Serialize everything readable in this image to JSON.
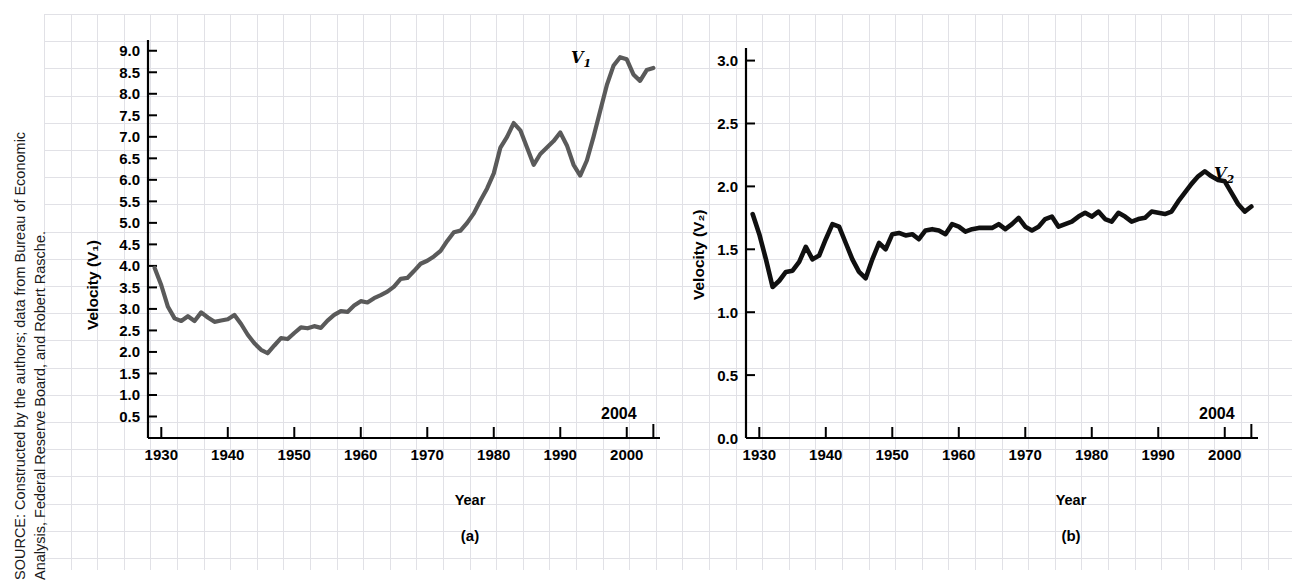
{
  "source_note": "SOURCE: Constructed by the authors; data from Bureau of Economic\nAnalysis, Federal Reserve Board, and Robert Rasche.",
  "colors": {
    "v1_line": "#5a5a5a",
    "v2_line": "#101010",
    "axis": "#000000",
    "grid": "#c9c9d2"
  },
  "chart_data": [
    {
      "type": "line",
      "panel": "a",
      "caption": "(a)",
      "title": "",
      "xlabel": "Year",
      "ylabel": "Velocity (V₁)",
      "series_label": "V",
      "series_subscript": "1",
      "end_year_label": "2004",
      "xlim": [
        1928,
        2005
      ],
      "ylim": [
        0,
        9.25
      ],
      "xticks": [
        1930,
        1940,
        1950,
        1960,
        1970,
        1980,
        1990,
        2000
      ],
      "xtick_labels": [
        "1930",
        "1940",
        "1950",
        "1960",
        "1970",
        "1980",
        "1990",
        "2000"
      ],
      "yticks": [
        0.5,
        1.0,
        1.5,
        2.0,
        2.5,
        3.0,
        3.5,
        4.0,
        4.5,
        5.0,
        5.5,
        6.0,
        6.5,
        7.0,
        7.5,
        8.0,
        8.5,
        9.0
      ],
      "ytick_labels": [
        "0.5",
        "1.0",
        "1.5",
        "2.0",
        "2.5",
        "3.0",
        "3.5",
        "4.0",
        "4.5",
        "5.0",
        "5.5",
        "6.0",
        "6.5",
        "7.0",
        "7.5",
        "8.0",
        "8.5",
        "9.0"
      ],
      "grid": false,
      "legend": "inline-annotation",
      "x": [
        1929,
        1930,
        1931,
        1932,
        1933,
        1934,
        1935,
        1936,
        1937,
        1938,
        1939,
        1940,
        1941,
        1942,
        1943,
        1944,
        1945,
        1946,
        1947,
        1948,
        1949,
        1950,
        1951,
        1952,
        1953,
        1954,
        1955,
        1956,
        1957,
        1958,
        1959,
        1960,
        1961,
        1962,
        1963,
        1964,
        1965,
        1966,
        1967,
        1968,
        1969,
        1970,
        1971,
        1972,
        1973,
        1974,
        1975,
        1976,
        1977,
        1978,
        1979,
        1980,
        1981,
        1982,
        1983,
        1984,
        1985,
        1986,
        1987,
        1988,
        1989,
        1990,
        1991,
        1992,
        1993,
        1994,
        1995,
        1996,
        1997,
        1998,
        1999,
        2000,
        2001,
        2002,
        2003,
        2004
      ],
      "values": [
        3.95,
        3.55,
        3.05,
        2.78,
        2.72,
        2.83,
        2.72,
        2.92,
        2.8,
        2.7,
        2.73,
        2.76,
        2.86,
        2.65,
        2.4,
        2.2,
        2.05,
        1.97,
        2.15,
        2.32,
        2.3,
        2.44,
        2.57,
        2.55,
        2.6,
        2.56,
        2.73,
        2.86,
        2.95,
        2.93,
        3.08,
        3.18,
        3.15,
        3.25,
        3.32,
        3.4,
        3.52,
        3.7,
        3.72,
        3.88,
        4.05,
        4.12,
        4.22,
        4.35,
        4.58,
        4.78,
        4.82,
        5.0,
        5.22,
        5.52,
        5.8,
        6.15,
        6.75,
        7.0,
        7.32,
        7.15,
        6.75,
        6.35,
        6.6,
        6.75,
        6.9,
        7.1,
        6.8,
        6.35,
        6.1,
        6.45,
        7.0,
        7.6,
        8.2,
        8.65,
        8.85,
        8.8,
        8.45,
        8.3,
        8.55,
        8.6
      ],
      "annotations": [
        {
          "text": "2004",
          "at_x": 2004,
          "position": "above-axis-right"
        },
        {
          "text": "V₁",
          "at_x": 1999,
          "at_y": 9.0,
          "position": "near-curve-peak"
        }
      ]
    },
    {
      "type": "line",
      "panel": "b",
      "caption": "(b)",
      "title": "",
      "xlabel": "Year",
      "ylabel": "Velocity (V₂)",
      "series_label": "V",
      "series_subscript": "2",
      "end_year_label": "2004",
      "xlim": [
        1928,
        2005
      ],
      "ylim": [
        0,
        3.1
      ],
      "xticks": [
        1930,
        1940,
        1950,
        1960,
        1970,
        1980,
        1990,
        2000
      ],
      "xtick_labels": [
        "1930",
        "1940",
        "1950",
        "1960",
        "1970",
        "1980",
        "1990",
        "2000"
      ],
      "yticks": [
        0.0,
        0.5,
        1.0,
        1.5,
        2.0,
        2.5,
        3.0
      ],
      "ytick_labels": [
        "0.0",
        "0.5",
        "1.0",
        "1.5",
        "2.0",
        "2.5",
        "3.0"
      ],
      "grid": false,
      "legend": "inline-annotation",
      "x": [
        1929,
        1930,
        1931,
        1932,
        1933,
        1934,
        1935,
        1936,
        1937,
        1938,
        1939,
        1940,
        1941,
        1942,
        1943,
        1944,
        1945,
        1946,
        1947,
        1948,
        1949,
        1950,
        1951,
        1952,
        1953,
        1954,
        1955,
        1956,
        1957,
        1958,
        1959,
        1960,
        1961,
        1962,
        1963,
        1964,
        1965,
        1966,
        1967,
        1968,
        1969,
        1970,
        1971,
        1972,
        1973,
        1974,
        1975,
        1976,
        1977,
        1978,
        1979,
        1980,
        1981,
        1982,
        1983,
        1984,
        1985,
        1986,
        1987,
        1988,
        1989,
        1990,
        1991,
        1992,
        1993,
        1994,
        1995,
        1996,
        1997,
        1998,
        1999,
        2000,
        2001,
        2002,
        2003,
        2004
      ],
      "values": [
        1.78,
        1.62,
        1.42,
        1.2,
        1.25,
        1.32,
        1.33,
        1.4,
        1.52,
        1.42,
        1.45,
        1.58,
        1.7,
        1.68,
        1.55,
        1.42,
        1.32,
        1.27,
        1.42,
        1.55,
        1.5,
        1.62,
        1.63,
        1.61,
        1.62,
        1.58,
        1.65,
        1.66,
        1.65,
        1.62,
        1.7,
        1.68,
        1.64,
        1.66,
        1.67,
        1.67,
        1.67,
        1.7,
        1.66,
        1.7,
        1.75,
        1.68,
        1.65,
        1.68,
        1.74,
        1.76,
        1.68,
        1.7,
        1.72,
        1.76,
        1.79,
        1.76,
        1.8,
        1.74,
        1.72,
        1.79,
        1.76,
        1.72,
        1.74,
        1.75,
        1.8,
        1.79,
        1.78,
        1.8,
        1.88,
        1.95,
        2.02,
        2.08,
        2.12,
        2.08,
        2.05,
        2.04,
        1.95,
        1.86,
        1.8,
        1.84
      ],
      "annotations": [
        {
          "text": "2004",
          "at_x": 2004,
          "position": "above-axis-right"
        },
        {
          "text": "V₂",
          "at_x": 2000,
          "at_y": 2.15,
          "position": "near-curve-peak"
        }
      ]
    }
  ]
}
